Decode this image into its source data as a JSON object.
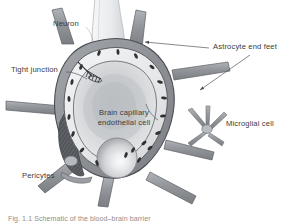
{
  "figure": {
    "background_color": "#ffffff",
    "text_color": "#3b3b3b"
  },
  "labels": {
    "neuron": "Neuron",
    "tight_junction": "Tight junction",
    "astrocyte_end_feet": "Astrocyte end feet",
    "microglial_cell": "Microglial cell",
    "pericytes": "Pericytes",
    "endothelial_line1": "Brain capillary",
    "endothelial_line2": "endothelial cell"
  },
  "caption": {
    "text": "Fig. 1.1  Schematic of the blood–brain barrier"
  },
  "colors": {
    "astrocyte_fill": "#8e9196",
    "astrocyte_fill_light": "#a9acb1",
    "astrocyte_outline": "#4d5155",
    "endothelium_fill": "#e9eaec",
    "endothelium_outline": "#5b5f63",
    "lumen_fill": "#c9cbce",
    "lumen_fill_outer": "#dcdee0",
    "nucleus_fill": "#d7d9dc",
    "nucleus_highlight": "#f4f5f6",
    "pericyte_fill": "#6f7277",
    "neuron_fill": "#eceef0",
    "neuron_outline": "#b6b9bd",
    "mitochondria": "#2e3134",
    "leader_line": "#55585c",
    "microglia_fill": "#c3c6ca",
    "microglia_outline": "#7e8287"
  },
  "structures": [
    {
      "name": "neuron-process",
      "description": "pale club-shaped neuronal process entering from top"
    },
    {
      "name": "astrocyte-end-feet",
      "description": "grey sheath surrounding the capillary with radiating processes"
    },
    {
      "name": "brain-capillary-endothelial-cell",
      "description": "light ring forming the vessel wall"
    },
    {
      "name": "capillary-lumen",
      "description": "shaded interior of the capillary"
    },
    {
      "name": "endothelial-nucleus",
      "description": "large spherical nucleus at the lower vessel wall"
    },
    {
      "name": "pericyte",
      "description": "dark hatched cell embedded in the basement membrane at lower left"
    },
    {
      "name": "microglial-cell",
      "description": "star-shaped cell with five processes at the right"
    },
    {
      "name": "tight-junction",
      "description": "junction between adjacent endothelial cells at upper left"
    },
    {
      "name": "mitochondria",
      "description": "small dark oval organelles scattered in the endothelial cytoplasm"
    }
  ]
}
